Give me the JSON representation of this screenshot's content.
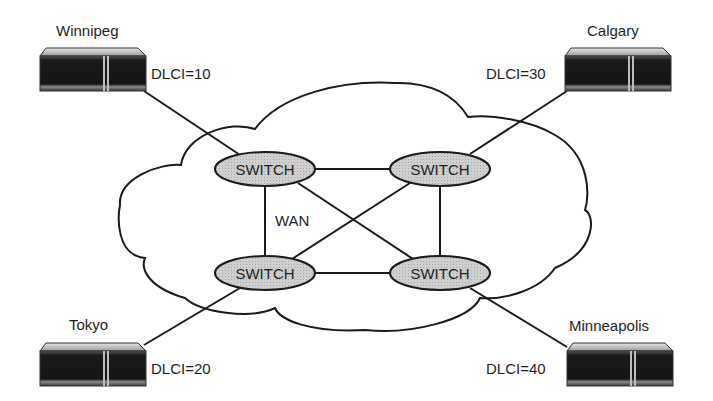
{
  "diagram": {
    "type": "frame-relay-network",
    "cloud_label": "WAN",
    "switch_label": "SWITCH",
    "colors": {
      "switch_fill": "#c8c8c8",
      "stroke": "#1a1a1a",
      "router_body": "#1c1c1c",
      "router_top": "#d8d8d8"
    },
    "sites": [
      {
        "name": "Winnipeg",
        "dlci": "DLCI=10"
      },
      {
        "name": "Calgary",
        "dlci": "DLCI=30"
      },
      {
        "name": "Tokyo",
        "dlci": "DLCI=20"
      },
      {
        "name": "Minneapolis",
        "dlci": "DLCI=40"
      }
    ],
    "switches": [
      {
        "id": "top-left"
      },
      {
        "id": "top-right"
      },
      {
        "id": "bottom-left"
      },
      {
        "id": "bottom-right"
      }
    ],
    "links": [
      [
        "Winnipeg",
        "top-left"
      ],
      [
        "Calgary",
        "top-right"
      ],
      [
        "Tokyo",
        "bottom-left"
      ],
      [
        "Minneapolis",
        "bottom-right"
      ],
      [
        "top-left",
        "top-right"
      ],
      [
        "top-left",
        "bottom-left"
      ],
      [
        "top-left",
        "bottom-right"
      ],
      [
        "top-right",
        "bottom-left"
      ],
      [
        "top-right",
        "bottom-right"
      ],
      [
        "bottom-left",
        "bottom-right"
      ]
    ]
  }
}
